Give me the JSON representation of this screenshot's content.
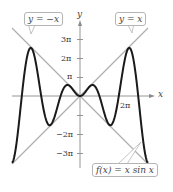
{
  "chart_data": {
    "type": "line",
    "title": "",
    "xlabel": "x",
    "ylabel": "y",
    "xlim": [
      -3.5,
      3.5
    ],
    "ylim": [
      -3.5,
      3.5
    ],
    "units": "multiples of pi",
    "grid": false,
    "y_ticks": [
      {
        "value": 3,
        "label": "3π"
      },
      {
        "value": 2,
        "label": "2π"
      },
      {
        "value": 1,
        "label": "π"
      },
      {
        "value": -2,
        "label": "−2π"
      },
      {
        "value": -3,
        "label": "−3π"
      }
    ],
    "x_ticks": [
      {
        "value": 2,
        "label": "2π"
      }
    ],
    "series": [
      {
        "name": "f(x) = x sin x",
        "style": "solid",
        "color": "#1a1a1a",
        "width": 2,
        "x": [
          -3.5,
          -3,
          -2.5,
          -2,
          -1.5,
          -1,
          -0.5,
          0,
          0.5,
          1,
          1.5,
          2,
          2.5,
          3,
          3.5
        ],
        "y": [
          -3.5,
          0,
          2.5,
          0,
          -1.5,
          0,
          0.5,
          0,
          0.5,
          0,
          -1.5,
          0,
          2.5,
          0,
          -3.5
        ]
      },
      {
        "name": "y = x",
        "style": "solid",
        "color": "#b0b0b0",
        "width": 1.3,
        "x": [
          -3.5,
          3.5
        ],
        "y": [
          -3.5,
          3.5
        ]
      },
      {
        "name": "y = −x",
        "style": "solid",
        "color": "#b0b0b0",
        "width": 1.3,
        "x": [
          -3.5,
          3.5
        ],
        "y": [
          3.5,
          -3.5
        ]
      }
    ],
    "annotations": [
      "y = −x",
      "y = x",
      "f(x) = x sin x"
    ]
  },
  "labels": {
    "callout_neg": "y = −x",
    "callout_pos": "y = x",
    "callout_f": "f(x) = x sin x",
    "x_axis": "x",
    "y_axis": "y",
    "tick_3pi": "3π",
    "tick_2pi": "2π",
    "tick_pi": "π",
    "tick_m2pi": "−2π",
    "tick_m3pi": "−3π",
    "tick_x2pi": "2π"
  }
}
